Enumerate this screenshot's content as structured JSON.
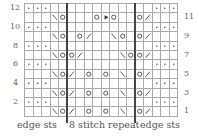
{
  "chart": {
    "rows": 12,
    "columns": 18,
    "left_row_numbers": [
      "12",
      "10",
      "8",
      "6",
      "4",
      "2"
    ],
    "right_row_numbers": [
      "11",
      "9",
      "7",
      "5",
      "3",
      "1"
    ],
    "labels": {
      "left_edge": "edge sts",
      "repeat": "8 stitch repeat",
      "right_edge": "edge sts"
    },
    "symbols": {
      ".": "purl-dot",
      "O": "yarn-over",
      "/": "k2tog",
      "\\": "ssk",
      "^": "double-decrease",
      "_": "knit-blank"
    },
    "pattern_rows_top_to_bottom": [
      "...____________...",
      "___\\O___O^O___O/___",
      "...____________...",
      "___\\O_O/__\\O__O/___",
      "...____________...",
      "___\\OO/____\\OO/___",
      "...____________...",
      "___\\O/_O_O_\\O/___",
      "...____________...",
      "___\\O/_O_O_\\O/___",
      "...____________...",
      "___\\O/_O_O_\\O/___"
    ]
  }
}
